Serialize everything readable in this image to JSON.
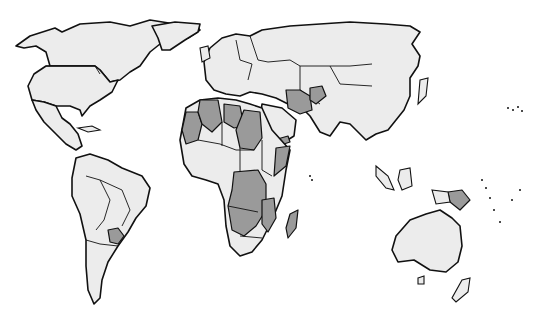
{
  "map": {
    "type": "world-choropleth",
    "projection": "equirectangular-like",
    "colors": {
      "background": "#ffffff",
      "land": "#ececec",
      "highlighted": "#9a9a9a",
      "border": "#111111"
    },
    "legend": null,
    "highlighted_regions": [
      "Western Sahara",
      "Mauritania",
      "Algeria",
      "Libya",
      "Sudan",
      "Chad",
      "Mali",
      "Somalia",
      "Central African Republic",
      "Democratic Republic of the Congo",
      "Angola",
      "Zambia",
      "Tanzania",
      "Mozambique",
      "Zimbabwe",
      "Botswana",
      "Madagascar",
      "Iran",
      "Afghanistan",
      "Yemen",
      "Paraguay",
      "Papua New Guinea"
    ]
  }
}
